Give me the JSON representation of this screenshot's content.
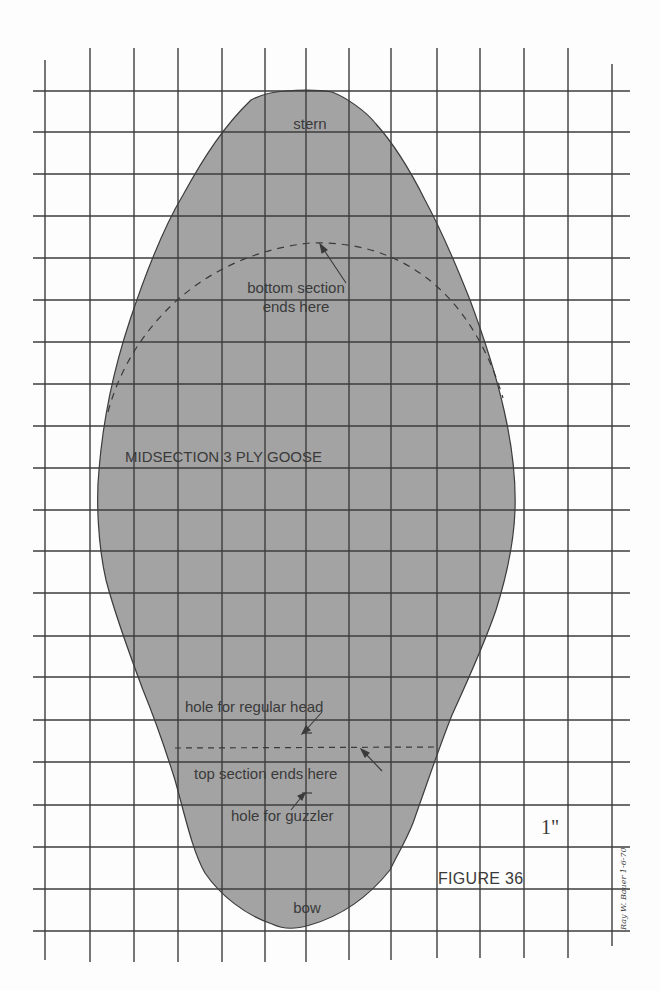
{
  "figure": {
    "title": "FIGURE 36",
    "scale_label": "1\"",
    "signature": "Ray W. Bauer 1-6-70",
    "part_label": "MIDSECTION 3 PLY GOOSE"
  },
  "labels": {
    "stern": "stern",
    "bottom_section_line1": "bottom section",
    "bottom_section_line2": "ends here",
    "hole_regular": "hole for regular head",
    "top_section": "top section ends here",
    "hole_guzzler": "hole for guzzler",
    "bow": "bow"
  },
  "grid": {
    "unit": "1 inch",
    "vertical_lines_x": [
      45,
      90,
      134,
      178,
      222,
      265,
      306,
      349,
      391,
      437,
      480,
      524,
      568,
      612
    ],
    "horizontal_lines_y": [
      91,
      132,
      174,
      216,
      258,
      300,
      342,
      384,
      426,
      468,
      510,
      551,
      593,
      636,
      677,
      720,
      762,
      805,
      847,
      889,
      931
    ]
  },
  "colors": {
    "shape_fill": "#a3a3a3",
    "grid_line": "#3c3c3c",
    "background": "#fdfdfd",
    "text": "#3a3a3a"
  }
}
